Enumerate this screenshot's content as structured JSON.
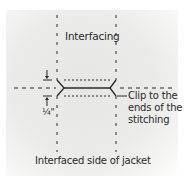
{
  "diagram": {
    "title_label": "Interfacing",
    "measurement_label": "¼\"",
    "callout_lines": [
      "Clip to the",
      "ends of the",
      "stitching"
    ],
    "bottom_label": "Interfaced side of jacket",
    "colors": {
      "background": "#ffffff",
      "panel": "#e8e8e6",
      "line": "#2a2a2a"
    }
  }
}
